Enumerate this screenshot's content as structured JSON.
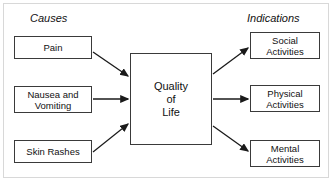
{
  "diagram": {
    "headers": {
      "left": "Causes",
      "right": "Indications"
    },
    "center_node": {
      "id": "quality-of-life",
      "label": "Quality\nof\nLife"
    },
    "causes": [
      {
        "id": "pain",
        "label": "Pain"
      },
      {
        "id": "nausea",
        "label": "Nausea and\nVomiting"
      },
      {
        "id": "skin",
        "label": "Skin Rashes"
      }
    ],
    "indications": [
      {
        "id": "social",
        "label": "Social\nActivities"
      },
      {
        "id": "physical",
        "label": "Physical\nActivities"
      },
      {
        "id": "mental",
        "label": "Mental\nActivities"
      }
    ],
    "edges": [
      {
        "from": "pain",
        "to": "quality-of-life",
        "style": "diagonal-down"
      },
      {
        "from": "nausea",
        "to": "quality-of-life",
        "style": "horizontal"
      },
      {
        "from": "skin",
        "to": "quality-of-life",
        "style": "diagonal-up"
      },
      {
        "from": "quality-of-life",
        "to": "social",
        "style": "diagonal-up"
      },
      {
        "from": "quality-of-life",
        "to": "physical",
        "style": "horizontal"
      },
      {
        "from": "quality-of-life",
        "to": "mental",
        "style": "diagonal-down"
      }
    ],
    "colors": {
      "box_border": "#3a3a3a",
      "edge": "#1a1a1a",
      "frame": "#d8d8d8",
      "text": "#111111",
      "background": "#ffffff"
    }
  }
}
